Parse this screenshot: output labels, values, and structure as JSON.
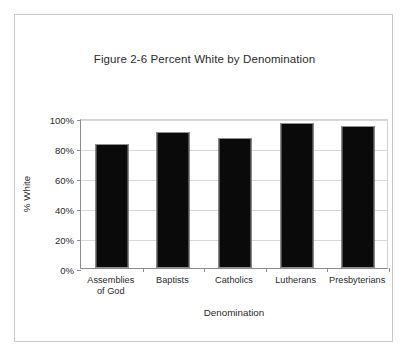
{
  "figure": {
    "title": "Figure 2-6 Percent White by Denomination"
  },
  "chart_data": {
    "type": "bar",
    "title": "Figure 2-6 Percent White by Denomination",
    "xlabel": "Denomination",
    "ylabel": "% White",
    "categories": [
      "Assemblies\nof God",
      "Baptists",
      "Catholics",
      "Lutherans",
      "Presbyterians"
    ],
    "values": [
      83,
      90.5,
      87,
      97,
      94.5
    ],
    "ylim": [
      0,
      100
    ],
    "ytick_labels": [
      "100%",
      "80%",
      "60%",
      "40%",
      "20%",
      "0%"
    ],
    "ytick_values": [
      100,
      80,
      60,
      40,
      20,
      0
    ],
    "grid": true,
    "legend": "none",
    "bar_color": "#0a0a0a",
    "bar_edge_color": "#8f8f8f",
    "grid_color": "#d8d8d8",
    "axis_color": "#8c8c8c",
    "frame_color": "#c9c9c9",
    "text_color": "#2b2b2b"
  }
}
